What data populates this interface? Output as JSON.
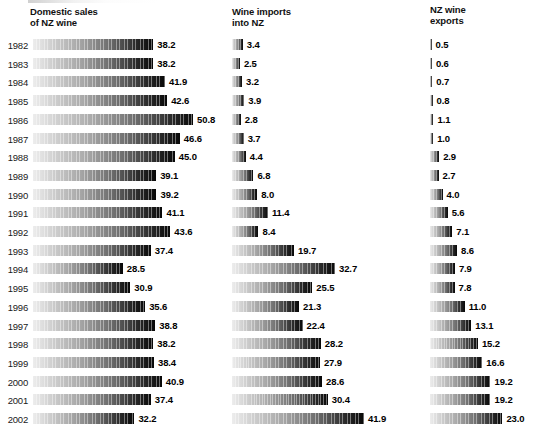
{
  "chart_data": {
    "type": "bar",
    "title": "",
    "subtitle": "",
    "orientation": "horizontal",
    "xlabel": "",
    "ylabel": "",
    "grid": false,
    "legend_position": "none",
    "value_format": "one decimal",
    "units": "millions of litres",
    "axis_note": "bars share a common linear scale across all three panels (~3.15 px per unit); no axis ticks drawn",
    "categories": [
      "1982",
      "1983",
      "1984",
      "1985",
      "1986",
      "1987",
      "1988",
      "1989",
      "1990",
      "1991",
      "1992",
      "1993",
      "1994",
      "1995",
      "1996",
      "1997",
      "1998",
      "1999",
      "2000",
      "2001",
      "2002"
    ],
    "series": [
      {
        "name": "Domestic sales of NZ wine",
        "values": [
          38.2,
          38.2,
          41.9,
          42.6,
          50.8,
          46.6,
          45.0,
          39.1,
          39.2,
          41.1,
          43.6,
          37.4,
          28.5,
          30.9,
          35.6,
          38.8,
          38.2,
          38.4,
          40.9,
          37.4,
          32.2
        ]
      },
      {
        "name": "Wine imports into NZ",
        "values": [
          3.4,
          2.5,
          3.2,
          3.9,
          2.8,
          3.7,
          4.4,
          6.8,
          8.0,
          11.4,
          8.4,
          19.7,
          32.7,
          25.5,
          21.3,
          22.4,
          28.2,
          27.9,
          28.6,
          30.4,
          41.9
        ]
      },
      {
        "name": "NZ wine exports",
        "values": [
          0.5,
          0.6,
          0.7,
          0.8,
          1.1,
          1.0,
          2.9,
          2.7,
          4.0,
          5.6,
          7.1,
          8.6,
          7.9,
          7.8,
          11.0,
          13.1,
          15.2,
          16.6,
          19.2,
          19.2,
          23.0
        ]
      }
    ],
    "value_labels": [
      [
        "38.2",
        "38.2",
        "41.9",
        "42.6",
        "50.8",
        "46.6",
        "45.0",
        "39.1",
        "39.2",
        "41.1",
        "43.6",
        "37.4",
        "28.5",
        "30.9",
        "35.6",
        "38.8",
        "38.2",
        "38.4",
        "40.9",
        "37.4",
        "32.2"
      ],
      [
        "3.4",
        "2.5",
        "3.2",
        "3.9",
        "2.8",
        "3.7",
        "4.4",
        "6.8",
        "8.0",
        "11.4",
        "8.4",
        "19.7",
        "32.7",
        "25.5",
        "21.3",
        "22.4",
        "28.2",
        "27.9",
        "28.6",
        "30.4",
        "41.9"
      ],
      [
        "0.5",
        "0.6",
        "0.7",
        "0.8",
        "1.1",
        "1.0",
        "2.9",
        "2.7",
        "4.0",
        "5.6",
        "7.1",
        "8.6",
        "7.9",
        "7.8",
        "11.0",
        "13.1",
        "15.2",
        "16.6",
        "19.2",
        "19.2",
        "23.0"
      ]
    ]
  },
  "panels": [
    {
      "id": "sales",
      "title": "Domestic sales\nof NZ wine",
      "series_index": 0,
      "show_years": true
    },
    {
      "id": "imports",
      "title": "Wine imports\ninto NZ",
      "series_index": 1,
      "show_years": false
    },
    {
      "id": "exports",
      "title": "NZ wine\nexports",
      "series_index": 2,
      "show_years": false
    }
  ],
  "style": {
    "bar_gradient_start": "#ededed",
    "bar_gradient_end": "#080808",
    "text_color": "#000000",
    "background": "#ffffff"
  },
  "layout": {
    "first_row_top": 38,
    "row_pitch": 18.7,
    "px_per_unit": 3.15,
    "bar_height": 11
  }
}
